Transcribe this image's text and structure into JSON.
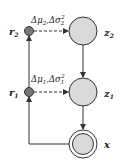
{
  "diagram": {
    "nodes": [
      {
        "id": "r2",
        "label": "r",
        "sub": "2",
        "kind": "small-filled"
      },
      {
        "id": "r1",
        "label": "r",
        "sub": "1",
        "kind": "small-filled"
      },
      {
        "id": "z2",
        "label": "z",
        "sub": "2",
        "kind": "latent"
      },
      {
        "id": "z1",
        "label": "z",
        "sub": "1",
        "kind": "latent"
      },
      {
        "id": "x",
        "label": "x",
        "sub": "",
        "kind": "observed"
      }
    ],
    "edges": [
      {
        "from": "r2",
        "to": "z2",
        "style": "dashed",
        "label_mu": "Δμ",
        "label_mu_sub": "2",
        "label_sigma": "Δσ",
        "label_sigma_sub": "2",
        "label_sigma_sup": "2"
      },
      {
        "from": "r1",
        "to": "z1",
        "style": "dashed",
        "label_mu": "Δμ",
        "label_mu_sub": "1",
        "label_sigma": "Δσ",
        "label_sigma_sub": "1",
        "label_sigma_sup": "2"
      },
      {
        "from": "z2",
        "to": "z1",
        "style": "solid"
      },
      {
        "from": "z1",
        "to": "x",
        "style": "solid"
      },
      {
        "from": "x",
        "to": "r1",
        "style": "solid"
      },
      {
        "from": "r1",
        "to": "r2",
        "style": "solid"
      }
    ],
    "colors": {
      "latent_fill": "#d9d9d9",
      "small_fill": "#777777",
      "stroke": "#333333"
    }
  }
}
